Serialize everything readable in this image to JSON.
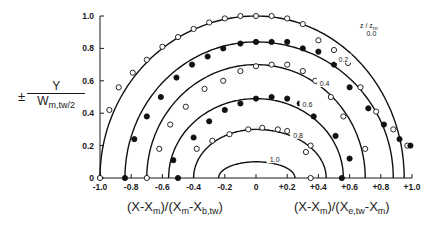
{
  "chart_data": {
    "type": "scatter",
    "title": "",
    "ylabel": "± Y / W_m,tw/2",
    "ylabel_parts": {
      "pm": "±",
      "numerator": "Y",
      "denominator": "W",
      "denominator_sub": "m,tw/2"
    },
    "xlabel_left": "(X-X_m)/(X_m-X_b,tw)",
    "xlabel_right": "(X-X_m)/(X_e,tw-X_m)",
    "xlim": [
      -1.0,
      1.0
    ],
    "ylim": [
      0,
      1.0
    ],
    "x_ticks": [
      "-1.0",
      "-0.8",
      "-0.6",
      "-0.4",
      "-0.2",
      "0",
      "+0.2",
      "+0.4",
      "+0.6",
      "+0.8",
      "+1.0"
    ],
    "x_tick_values": [
      -1.0,
      -0.8,
      -0.6,
      -0.4,
      -0.2,
      0,
      0.2,
      0.4,
      0.6,
      0.8,
      1.0
    ],
    "y_ticks": [
      "0",
      "0.2",
      "0.4",
      "0.6",
      "0.8",
      "1.0"
    ],
    "y_tick_values": [
      0,
      0.2,
      0.4,
      0.6,
      0.8,
      1.0
    ],
    "grid": false,
    "legend_title": "z/z_m",
    "series": [
      {
        "name": "0.0",
        "marker": "open",
        "curve": {
          "x_left": -1.0,
          "x_right": 0.95,
          "peak_y": 1.0
        },
        "points": [
          [
            -1.0,
            0.0
          ],
          [
            -0.94,
            0.42
          ],
          [
            -0.88,
            0.56
          ],
          [
            -0.79,
            0.65
          ],
          [
            -0.7,
            0.73
          ],
          [
            -0.6,
            0.81
          ],
          [
            -0.5,
            0.87
          ],
          [
            -0.4,
            0.92
          ],
          [
            -0.3,
            0.96
          ],
          [
            -0.2,
            0.985
          ],
          [
            -0.1,
            1.0
          ],
          [
            0.0,
            1.0
          ],
          [
            0.1,
            1.0
          ],
          [
            0.2,
            0.985
          ],
          [
            0.3,
            0.95
          ],
          [
            0.4,
            0.85
          ],
          [
            0.5,
            0.79
          ],
          [
            0.59,
            0.71
          ],
          [
            0.67,
            0.56
          ],
          [
            0.77,
            0.41
          ],
          [
            0.88,
            0.3
          ],
          [
            0.97,
            0.2
          ]
        ]
      },
      {
        "name": "0.2",
        "marker": "filled",
        "curve": {
          "x_left": -0.84,
          "x_right": 0.88,
          "peak_y": 0.84
        },
        "points": [
          [
            -0.84,
            0.0
          ],
          [
            -0.78,
            0.24
          ],
          [
            -0.7,
            0.38
          ],
          [
            -0.61,
            0.5
          ],
          [
            -0.51,
            0.62
          ],
          [
            -0.41,
            0.7
          ],
          [
            -0.31,
            0.75
          ],
          [
            -0.21,
            0.8
          ],
          [
            -0.1,
            0.83
          ],
          [
            0.0,
            0.84
          ],
          [
            0.1,
            0.84
          ],
          [
            0.2,
            0.84
          ],
          [
            0.3,
            0.8
          ],
          [
            0.4,
            0.78
          ],
          [
            0.5,
            0.7
          ],
          [
            0.6,
            0.56
          ],
          [
            0.72,
            0.43
          ],
          [
            0.82,
            0.33
          ],
          [
            0.92,
            0.24
          ],
          [
            0.99,
            0.2
          ]
        ]
      },
      {
        "name": "0.4",
        "marker": "open",
        "curve": {
          "x_left": -0.7,
          "x_right": 0.7,
          "peak_y": 0.7
        },
        "points": [
          [
            -0.7,
            0.0
          ],
          [
            -0.62,
            0.18
          ],
          [
            -0.55,
            0.33
          ],
          [
            -0.45,
            0.44
          ],
          [
            -0.33,
            0.55
          ],
          [
            -0.21,
            0.6
          ],
          [
            -0.1,
            0.66
          ],
          [
            0.0,
            0.69
          ],
          [
            0.1,
            0.7
          ],
          [
            0.2,
            0.7
          ],
          [
            0.3,
            0.66
          ],
          [
            0.38,
            0.6
          ],
          [
            0.48,
            0.5
          ],
          [
            0.56,
            0.38
          ],
          [
            0.7,
            0.18
          ]
        ]
      },
      {
        "name": "0.6",
        "marker": "filled",
        "curve": {
          "x_left": -0.56,
          "x_right": 0.56,
          "peak_y": 0.49
        },
        "points": [
          [
            -0.5,
            0.0
          ],
          [
            -0.53,
            0.11
          ],
          [
            -0.4,
            0.25
          ],
          [
            -0.3,
            0.35
          ],
          [
            -0.2,
            0.42
          ],
          [
            -0.1,
            0.46
          ],
          [
            0.0,
            0.49
          ],
          [
            0.1,
            0.5
          ],
          [
            0.2,
            0.49
          ],
          [
            0.28,
            0.46
          ],
          [
            0.37,
            0.38
          ],
          [
            0.51,
            0.26
          ],
          [
            0.6,
            0.12
          ],
          [
            0.55,
            0.0
          ]
        ]
      },
      {
        "name": "0.8",
        "marker": "open",
        "curve": {
          "x_left": -0.4,
          "x_right": 0.45,
          "peak_y": 0.3
        },
        "points": [
          [
            -0.38,
            0.18
          ],
          [
            -0.28,
            0.23
          ],
          [
            -0.17,
            0.27
          ],
          [
            -0.05,
            0.3
          ],
          [
            0.04,
            0.31
          ],
          [
            0.14,
            0.3
          ],
          [
            0.2,
            0.29
          ],
          [
            0.28,
            0.26
          ],
          [
            0.35,
            0.2
          ],
          [
            0.32,
            0.16
          ],
          [
            0.35,
            0.0
          ]
        ]
      },
      {
        "name": "1.0",
        "marker": "none",
        "curve": {
          "x_left": -0.24,
          "x_right": 0.25,
          "peak_y": 0.1
        },
        "points": []
      }
    ],
    "curve_labels": [
      {
        "text": "0.0",
        "x": 0.74,
        "y": 0.89
      },
      {
        "text": "0.2",
        "x": 0.56,
        "y": 0.73
      },
      {
        "text": "0.4",
        "x": 0.44,
        "y": 0.58
      },
      {
        "text": "0.6",
        "x": 0.33,
        "y": 0.45
      },
      {
        "text": "0.8",
        "x": 0.27,
        "y": 0.26
      },
      {
        "text": "1.0",
        "x": 0.12,
        "y": 0.11
      }
    ],
    "annotations": [
      {
        "text": "z/z_m",
        "x": 0.82,
        "y": 1.0
      }
    ]
  },
  "labels": {
    "y_pm": "±",
    "y_num": "Y",
    "y_den": "W",
    "y_den_sub": "m,tw/2",
    "legend_main": "z / z",
    "legend_sub": "m"
  }
}
